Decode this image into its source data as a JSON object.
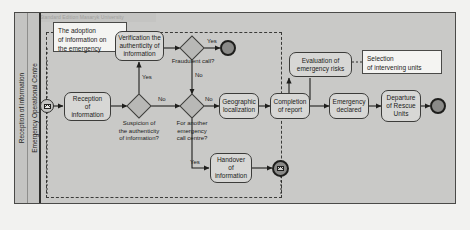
{
  "diagram": {
    "watermark": "Paradigm Standard Edition Masaryk University",
    "lanes": {
      "outer_label": "Reception of information",
      "inner_label": "Emergency Operational Centre"
    },
    "notes": [
      {
        "id": "note-adoption",
        "text": "The adoption\nof information on\nthe emergency"
      },
      {
        "id": "note-selection",
        "text": "Selection\nof intervening units"
      }
    ],
    "activities": [
      {
        "id": "act-reception",
        "label": "Reception\nof\ninformation"
      },
      {
        "id": "act-verification",
        "label": "Verification the\nauthenticity of\ninformation"
      },
      {
        "id": "act-geographic",
        "label": "Geographic\nlocalization"
      },
      {
        "id": "act-completion",
        "label": "Completion\nof report"
      },
      {
        "id": "act-evaluation",
        "label": "Evaluation of\nemergency risks"
      },
      {
        "id": "act-declared",
        "label": "Emergency\ndeclared"
      },
      {
        "id": "act-departure",
        "label": "Departure\nof Rescue\nUnits"
      },
      {
        "id": "act-handover",
        "label": "Handover\nof\ninformation"
      }
    ],
    "gateways": [
      {
        "id": "gw-suspicion",
        "label": "Suspicion of\nthe authenticity\nof information?"
      },
      {
        "id": "gw-fraudulent",
        "label": "Fraudulent call?"
      },
      {
        "id": "gw-another-centre",
        "label": "For another\nemergency\ncall centre?"
      }
    ],
    "events": [
      {
        "id": "event-start-message",
        "kind": "start",
        "icon": "envelope-icon"
      },
      {
        "id": "event-end-fraudulent",
        "kind": "end",
        "icon": "none"
      },
      {
        "id": "event-end-handover",
        "kind": "end",
        "icon": "envelope-icon"
      },
      {
        "id": "event-end-departure",
        "kind": "end",
        "icon": "none"
      }
    ],
    "flow_labels": {
      "yes_verification": "Yes",
      "no_suspicion": "No",
      "no_fraudulent": "No",
      "no_another_centre": "No",
      "yes_fraudulent": "Yes",
      "yes_another_centre": "Yes"
    },
    "colors": {
      "frame_fill": "#c9c9c7",
      "activity_fill": "#d7d7d5",
      "gateway_fill": "#b8b8b6",
      "note_fill": "#f4f4f2",
      "stroke": "#3c3c3a",
      "end_event_fill": "#8a8a88"
    }
  }
}
